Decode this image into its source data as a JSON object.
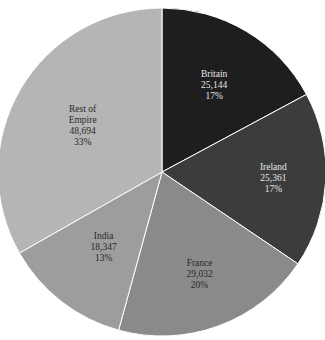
{
  "chart_data": {
    "type": "pie",
    "title": "",
    "start_angle_deg": 0,
    "direction": "clockwise",
    "categories": [
      "Britain",
      "Ireland",
      "France",
      "India",
      "Rest of Empire"
    ],
    "values": [
      25144,
      25361,
      29032,
      18347,
      48694
    ],
    "percent_labels": [
      "17%",
      "17%",
      "20%",
      "13%",
      "33%"
    ],
    "value_labels": [
      "25,144",
      "25,361",
      "29,032",
      "18,347",
      "48,694"
    ],
    "label_lines": [
      [
        "Britain"
      ],
      [
        "Ireland"
      ],
      [
        "France"
      ],
      [
        "India"
      ],
      [
        "Rest of",
        "Empire"
      ]
    ],
    "colors": [
      "#1e1e1e",
      "#3c3c3c",
      "#8a8a8a",
      "#9d9d9d",
      "#b5b5b5"
    ],
    "label_colors": [
      "#e6e6e6",
      "#e6e6e6",
      "#2a2a2a",
      "#2a2a2a",
      "#2a2a2a"
    ],
    "separator_color": "#ffffff",
    "legend": "none"
  }
}
